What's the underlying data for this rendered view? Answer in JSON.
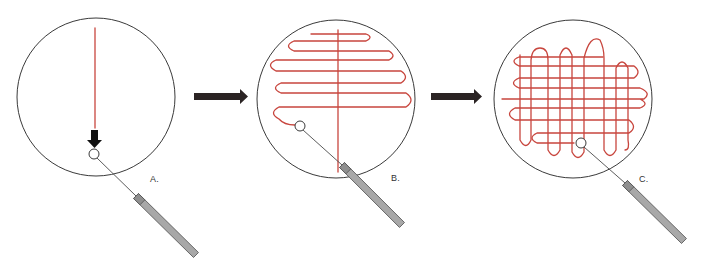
{
  "figure": {
    "colors": {
      "streak": "#c8463e",
      "plate_outline": "#3a3a3a",
      "handle": "#a8a8a8",
      "arrow": "#2b2424"
    }
  },
  "panels": [
    {
      "label": "A.",
      "label_pos": [
        150,
        174
      ],
      "plate": {
        "cx": 96,
        "cy": 97,
        "r": 79
      },
      "loop": {
        "cx": 94,
        "cy": 154,
        "r": 5
      },
      "wire": {
        "x1": 97,
        "y1": 158,
        "x2": 136,
        "y2": 196
      },
      "handle": {
        "x1": 136,
        "y1": 196,
        "x2": 196,
        "y2": 255
      },
      "streak_path": "M 95 28 L 95 128",
      "down_arrow": "M 91 130 L 98 130 L 98 140 L 102 140 L 94.5 148 L 87 140 L 91 140 Z"
    },
    {
      "label": "B.",
      "label_pos": [
        391,
        173
      ],
      "plate": {
        "cx": 336,
        "cy": 99,
        "r": 79
      },
      "loop": {
        "cx": 300,
        "cy": 126,
        "r": 5
      },
      "wire": {
        "x1": 303,
        "y1": 130,
        "x2": 342,
        "y2": 165
      },
      "handle": {
        "x1": 342,
        "y1": 165,
        "x2": 402,
        "y2": 225
      },
      "streak_path": "M 311 34 L 366 34 Q 374 37 366 41 L 294 41 Q 283 46 294 51 L 389 51 Q 397 56 389 60 L 276 60 Q 265 65 276 71 L 401 71 Q 410 77 401 83 L 281 83 Q 270 88 281 93 L 406 93 Q 416 100 406 107 L 279 107 Q 268 113 279 119 Q 284 125 295 125",
      "vertical_path": "M 338 30 L 338 172"
    },
    {
      "label": "C.",
      "label_pos": [
        639,
        174
      ],
      "plate": {
        "cx": 573,
        "cy": 99,
        "r": 79
      },
      "loop": {
        "cx": 581,
        "cy": 143,
        "r": 5
      },
      "wire": {
        "x1": 584,
        "y1": 147,
        "x2": 625,
        "y2": 183
      },
      "handle": {
        "x1": 625,
        "y1": 183,
        "x2": 684,
        "y2": 241
      },
      "streak_path": "M 574 143 L 537 143 Q 527 138 537 133 L 629 133 Q 638 127 629 120 L 515 120 Q 504 114 515 108 L 640 108 Q 650 104 640 99 L 502 99 L 644 99 Q 652 93 640 88 L 519 88 Q 508 83 519 78 L 634 78 Q 642 72 634 66 L 519 66 Q 509 61 519 57 L 603 57",
      "vertical_path": "M 520 55 L 520 140 Q 526 151 531 140 L 531 60 Q 532 48 540 48 Q 548 48 548 60 L 548 150 Q 554 161 560 150 L 560 55 Q 566 41 572 55 L 572 152 Q 578 163 584 152 L 584 58 Q 590 34 600 40 Q 604 48 604 58 L 604 150 Q 610 161 616 150 L 616 68 Q 622 56 628 68 L 628 140 Q 630 150 625 150"
    }
  ],
  "step_arrows": [
    {
      "name": "arrow-a-to-b",
      "path": "M 194 93 L 240 93 L 240 89 L 248 96.5 L 240 104 L 240 100 L 194 100 Z"
    },
    {
      "name": "arrow-b-to-c",
      "path": "M 431 93 L 474 93 L 474 89 L 482 96.5 L 474 104 L 474 100 L 431 100 Z"
    }
  ]
}
